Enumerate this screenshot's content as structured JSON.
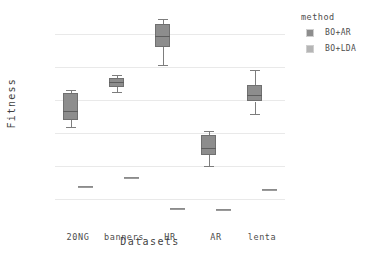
{
  "chart_data": {
    "type": "box",
    "title": "",
    "xlabel": "Datasets",
    "ylabel": "Fitness",
    "categories": [
      "20NG",
      "banners",
      "HR",
      "AR",
      "lenta"
    ],
    "ylim": [
      0.32,
      1.52
    ],
    "yticks": [
      1.4,
      1.2,
      1,
      0.8,
      0.6,
      0.4
    ],
    "ytick_labels": [
      "1.4",
      "1.2",
      "1",
      "0.8",
      "0.6",
      "0.4"
    ],
    "grid": true,
    "legend": {
      "title": "method",
      "position": "right",
      "entries": [
        {
          "label": "BO+AR",
          "color": "#8d8d8d"
        },
        {
          "label": "BO+LDA",
          "color": "#b5b5b5"
        }
      ]
    },
    "series": [
      {
        "name": "BO+AR",
        "color": "#8d8d8d",
        "boxes": [
          {
            "category": "20NG",
            "whisker_low": 0.835,
            "q1": 0.88,
            "median": 0.93,
            "q3": 1.04,
            "whisker_high": 1.06
          },
          {
            "category": "banners",
            "whisker_low": 1.05,
            "q1": 1.08,
            "median": 1.11,
            "q3": 1.13,
            "whisker_high": 1.15
          },
          {
            "category": "HR",
            "whisker_low": 1.21,
            "q1": 1.32,
            "median": 1.39,
            "q3": 1.46,
            "whisker_high": 1.49
          },
          {
            "category": "AR",
            "whisker_low": 0.6,
            "q1": 0.665,
            "median": 0.71,
            "q3": 0.785,
            "whisker_high": 0.81
          },
          {
            "category": "lenta",
            "whisker_low": 0.915,
            "q1": 0.99,
            "median": 1.03,
            "q3": 1.09,
            "whisker_high": 1.18
          }
        ]
      },
      {
        "name": "BO+LDA",
        "color": "#9a9a9a",
        "boxes": [
          {
            "category": "20NG",
            "whisker_low": 0.48,
            "q1": 0.48,
            "median": 0.48,
            "q3": 0.48,
            "whisker_high": 0.48
          },
          {
            "category": "banners",
            "whisker_low": 0.535,
            "q1": 0.535,
            "median": 0.535,
            "q3": 0.535,
            "whisker_high": 0.535
          },
          {
            "category": "HR",
            "whisker_low": 0.345,
            "q1": 0.345,
            "median": 0.345,
            "q3": 0.345,
            "whisker_high": 0.345
          },
          {
            "category": "AR",
            "whisker_low": 0.34,
            "q1": 0.34,
            "median": 0.34,
            "q3": 0.34,
            "whisker_high": 0.34
          },
          {
            "category": "lenta",
            "whisker_low": 0.46,
            "q1": 0.46,
            "median": 0.46,
            "q3": 0.46,
            "whisker_high": 0.46
          }
        ]
      }
    ]
  }
}
